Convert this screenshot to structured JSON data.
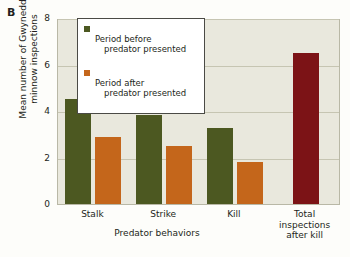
{
  "panel": {
    "label": "B"
  },
  "axes": {
    "ylabel": "Mean number of Gwynedd\nminnow inspections",
    "xlabel": "Predator behaviors",
    "yticks": [
      "0",
      "2",
      "4",
      "6",
      "8"
    ]
  },
  "legend": {
    "items": [
      {
        "color": "#4c5821",
        "line1": "Period before",
        "line2": "predator presented"
      },
      {
        "color": "#c4661b",
        "line1": "Period after",
        "line2": "predator presented"
      }
    ]
  },
  "chart_data": {
    "type": "bar",
    "title": "",
    "xlabel": "Predator behaviors",
    "ylabel": "Mean number of Gwynedd minnow inspections",
    "ylim": [
      0,
      8
    ],
    "yticks": [
      0,
      2,
      4,
      6,
      8
    ],
    "grid": true,
    "legend_position": "top-center",
    "categories": [
      "Stalk",
      "Strike",
      "Kill",
      "Total inspections after kill"
    ],
    "category_labels": [
      "Stalk",
      "Strike",
      "Kill",
      "Total\ninspections\nafter kill"
    ],
    "series": [
      {
        "name": "Period before predator presented",
        "color": "#4c5821",
        "values": [
          4.5,
          3.85,
          3.25,
          null
        ]
      },
      {
        "name": "Period after predator presented",
        "color": "#c4661b",
        "values": [
          2.9,
          2.5,
          1.8,
          null
        ]
      },
      {
        "name": "Total inspections after kill",
        "color": "#7c1316",
        "values": [
          null,
          null,
          null,
          6.5
        ]
      }
    ]
  },
  "colors": {
    "plot_background": "#e9e8dd",
    "page_background": "#fdfdfa",
    "gridline": "#c6c5b2",
    "green": "#4c5821",
    "orange": "#c4661b",
    "dark_red": "#7c1316"
  }
}
